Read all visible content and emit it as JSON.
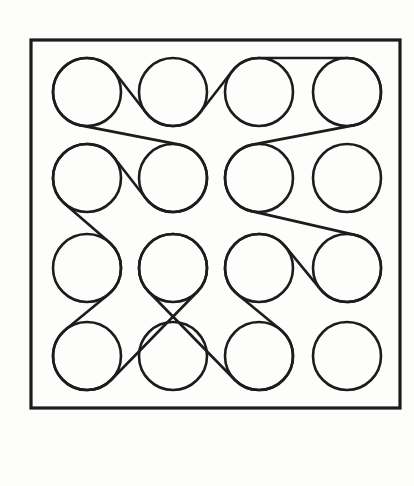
{
  "figure": {
    "width": 414,
    "height": 486,
    "stroke_color": "#1c1c1c",
    "background": "#fdfdfc",
    "frame": {
      "x": 31,
      "y": 40,
      "width": 369,
      "height": 368,
      "stroke_width": 3.2
    },
    "circle_radius": 34,
    "circle_stroke_width": 2.6,
    "belt_stroke_width": 2.6,
    "columns_x": [
      87,
      173,
      259,
      347
    ],
    "rows_y": [
      92,
      178,
      268,
      356
    ],
    "grid": "4x4",
    "belt": {
      "description": "A single closed belt woven around 13 of the 16 circles",
      "path": [
        {
          "row": 1,
          "col": 1,
          "wrap": 1
        },
        {
          "row": 1,
          "col": 2,
          "wrap": -1
        },
        {
          "row": 1,
          "col": 3,
          "wrap": 1
        },
        {
          "row": 1,
          "col": 4,
          "wrap": 1
        },
        {
          "row": 2,
          "col": 3,
          "wrap": -1
        },
        {
          "row": 3,
          "col": 4,
          "wrap": 1
        },
        {
          "row": 3,
          "col": 3,
          "wrap": -1
        },
        {
          "row": 4,
          "col": 3,
          "wrap": 1
        },
        {
          "row": 3,
          "col": 2,
          "wrap": 1
        },
        {
          "row": 4,
          "col": 1,
          "wrap": 1
        },
        {
          "row": 3,
          "col": 1,
          "wrap": -1
        },
        {
          "row": 2,
          "col": 1,
          "wrap": 1
        },
        {
          "row": 2,
          "col": 2,
          "wrap": -1
        }
      ],
      "unbelted_circles": [
        {
          "row": 2,
          "col": 4
        },
        {
          "row": 4,
          "col": 2
        },
        {
          "row": 4,
          "col": 4
        }
      ]
    }
  }
}
